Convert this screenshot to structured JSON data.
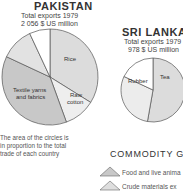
{
  "chart_data": [
    {
      "type": "pie",
      "title": "PAKISTAN",
      "subtitle_1": "Total exports 1979",
      "subtitle_2": "2 056 $ US million",
      "slices": [
        {
          "label": "Rice",
          "start_deg": 0,
          "end_deg": 122,
          "color": "#dcdcdc"
        },
        {
          "label": "Raw cotton",
          "start_deg": 122,
          "end_deg": 160,
          "color": "#eeeeee"
        },
        {
          "label": "Textile yarns and fabrics",
          "start_deg": 160,
          "end_deg": 295,
          "color": "#c8c8c8"
        },
        {
          "label": "",
          "start_deg": 295,
          "end_deg": 335,
          "color": "#e2e2e2"
        },
        {
          "label": "",
          "start_deg": 335,
          "end_deg": 360,
          "color": "#ffffff"
        }
      ]
    },
    {
      "type": "pie",
      "title": "SRI LANKA",
      "subtitle_1": "Total exports 1979",
      "subtitle_2": "978 $ US million",
      "slices": [
        {
          "label": "Tea",
          "start_deg": 0,
          "end_deg": 190,
          "color": "#dcdcdc"
        },
        {
          "label": "Rubber",
          "start_deg": 190,
          "end_deg": 295,
          "color": "#ececec"
        },
        {
          "label": "",
          "start_deg": 295,
          "end_deg": 360,
          "color": "#ffffff"
        }
      ]
    }
  ],
  "pakistan": {
    "title": "PAKISTAN",
    "sub1": "Total exports 1979",
    "sub2": "2 056 $ US million",
    "labels": {
      "rice": "Rice",
      "raw1": "Raw",
      "raw2": "cotton",
      "tex1": "Textile yarns",
      "tex2": "and fabrics"
    }
  },
  "srilanka": {
    "title": "SRI LANKA",
    "sub1": "Total exports 1979",
    "sub2": "978 $ US million",
    "labels": {
      "tea": "Tea",
      "rubber": "Rubber"
    }
  },
  "note": {
    "line1": "The area of the circles is",
    "line2": "in proportion to the total",
    "line3": "trade of each country"
  },
  "legend": {
    "title": "COMMODITY G",
    "items": [
      {
        "label": "Food and live anima"
      },
      {
        "label": "Crude materials ex"
      }
    ]
  }
}
